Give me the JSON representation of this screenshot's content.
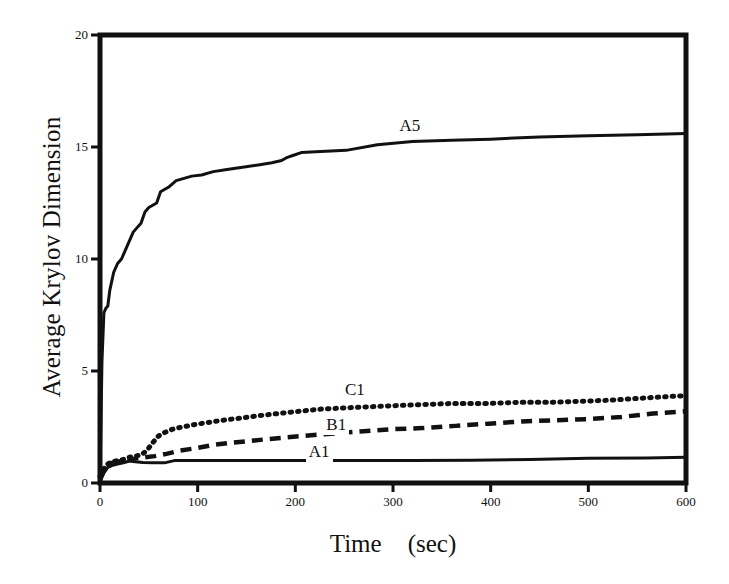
{
  "chart_data": {
    "type": "line",
    "title": "",
    "xlabel": "Time",
    "xunit": "(sec)",
    "ylabel": "Average Krylov Dimension",
    "xlim": [
      0,
      600
    ],
    "ylim": [
      0,
      20
    ],
    "xticks": [
      "0",
      "100",
      "200",
      "300",
      "400",
      "500",
      "600"
    ],
    "xtick_values": [
      0,
      100,
      200,
      300,
      400,
      500,
      600
    ],
    "yticks": [
      "0",
      "5",
      "10",
      "15",
      "20"
    ],
    "ytick_values": [
      0,
      5,
      10,
      15,
      20
    ],
    "grid": false,
    "legend_position": "inline-on-curve",
    "series": [
      {
        "name": "A5",
        "style": "solid",
        "color": "#111111",
        "label_x": 318,
        "label_y": 15.9,
        "x": [
          0,
          2,
          4,
          6,
          8,
          10,
          14,
          18,
          22,
          26,
          30,
          34,
          38,
          42,
          46,
          50,
          54,
          58,
          62,
          66,
          70,
          78,
          86,
          94,
          104,
          116,
          130,
          146,
          162,
          176,
          186,
          190,
          196,
          206,
          226,
          252,
          284,
          320,
          360,
          400,
          450,
          500,
          550,
          600
        ],
        "y": [
          0.0,
          5.4,
          7.6,
          7.8,
          7.9,
          8.6,
          9.4,
          9.8,
          10.0,
          10.4,
          10.8,
          11.2,
          11.4,
          11.6,
          12.1,
          12.3,
          12.4,
          12.5,
          13.0,
          13.1,
          13.2,
          13.5,
          13.6,
          13.7,
          13.75,
          13.9,
          14.0,
          14.1,
          14.2,
          14.3,
          14.4,
          14.5,
          14.6,
          14.75,
          14.8,
          14.85,
          15.1,
          15.25,
          15.3,
          15.35,
          15.45,
          15.5,
          15.55,
          15.6
        ]
      },
      {
        "name": "C1",
        "style": "dotted",
        "color": "#111111",
        "label_x": 262,
        "label_y": 4.1,
        "x": [
          0,
          6,
          12,
          18,
          24,
          30,
          36,
          42,
          48,
          54,
          60,
          66,
          74,
          84,
          96,
          110,
          126,
          144,
          162,
          182,
          204,
          226,
          250,
          274,
          300,
          330,
          360,
          396,
          430,
          462,
          494,
          524,
          552,
          578,
          600
        ],
        "y": [
          0.3,
          0.8,
          0.95,
          1.0,
          1.05,
          1.15,
          1.2,
          1.25,
          1.45,
          1.8,
          2.1,
          2.25,
          2.4,
          2.5,
          2.6,
          2.7,
          2.8,
          2.9,
          3.0,
          3.1,
          3.2,
          3.3,
          3.35,
          3.4,
          3.45,
          3.5,
          3.55,
          3.55,
          3.6,
          3.6,
          3.65,
          3.7,
          3.78,
          3.85,
          3.9
        ]
      },
      {
        "name": "B1",
        "style": "dashed",
        "color": "#111111",
        "label_x": 243,
        "label_y": 2.55,
        "x": [
          0,
          6,
          12,
          18,
          24,
          30,
          38,
          46,
          56,
          68,
          82,
          98,
          116,
          136,
          158,
          182,
          208,
          236,
          266,
          298,
          330,
          364,
          398,
          432,
          466,
          500,
          534,
          566,
          600
        ],
        "y": [
          0.2,
          0.7,
          0.9,
          0.95,
          1.0,
          1.05,
          1.1,
          1.15,
          1.2,
          1.3,
          1.45,
          1.55,
          1.7,
          1.8,
          1.9,
          2.0,
          2.1,
          2.2,
          2.3,
          2.4,
          2.45,
          2.55,
          2.65,
          2.75,
          2.8,
          2.85,
          2.95,
          3.1,
          3.2
        ]
      },
      {
        "name": "A1",
        "style": "solid",
        "color": "#111111",
        "label_x": 225,
        "label_y": 1.35,
        "x": [
          0,
          4,
          8,
          12,
          18,
          24,
          30,
          36,
          44,
          54,
          66,
          76,
          90,
          120,
          160,
          210,
          260,
          320,
          380,
          440,
          500,
          560,
          600
        ],
        "y": [
          0.05,
          0.45,
          0.7,
          0.78,
          0.85,
          0.9,
          0.98,
          0.95,
          0.92,
          0.9,
          0.9,
          1.0,
          1.0,
          1.0,
          1.0,
          1.0,
          1.0,
          1.0,
          1.02,
          1.05,
          1.1,
          1.12,
          1.15
        ]
      }
    ]
  },
  "axes": {
    "frame_color": "#111111"
  }
}
